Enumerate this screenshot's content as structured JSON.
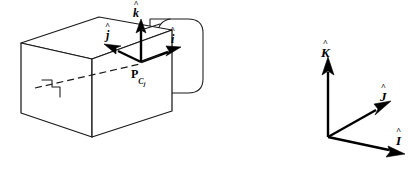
{
  "figure": {
    "background_color": "#ffffff",
    "line_color": "#1a1a1a",
    "vector_color": "#000000",
    "width_px": 420,
    "height_px": 173
  },
  "body_frame": {
    "origin_label_main": "P",
    "origin_label_sub": "C",
    "origin_label_subsub": "j",
    "axes": [
      {
        "name": "i-hat",
        "hat": "^",
        "glyph": "i",
        "label": "î"
      },
      {
        "name": "j-hat",
        "hat": "^",
        "glyph": "j",
        "label": "ĵ"
      },
      {
        "name": "k-hat",
        "hat": "^",
        "glyph": "k",
        "label": "k̂"
      }
    ]
  },
  "reference_frame": {
    "axes": [
      {
        "name": "I-hat",
        "hat": "^",
        "glyph": "I",
        "label": "Î"
      },
      {
        "name": "J-hat",
        "hat": "^",
        "glyph": "J",
        "label": "Ĵ"
      },
      {
        "name": "K-hat",
        "hat": "^",
        "glyph": "K",
        "label": "K̂"
      }
    ]
  },
  "shapes": {
    "box_name": "rectangular-link-body",
    "cylinder_name": "cylindrical-shaft",
    "notch_name": "step-notch",
    "hidden_edge_name": "hidden-center-axis"
  }
}
